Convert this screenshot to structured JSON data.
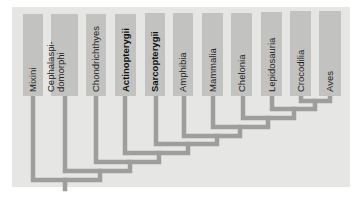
{
  "diagram": {
    "type": "cladogram",
    "colors": {
      "panel": "#e6e6e4",
      "box": "#c2c2c0",
      "branch": "#9e9e9c",
      "text": "#222222"
    },
    "taxa": [
      {
        "id": "mixini",
        "label": "Mixini",
        "bold": false
      },
      {
        "id": "cephalaspidomorphi",
        "label": "Cephalaspi-",
        "label2": "domorphi",
        "bold": false
      },
      {
        "id": "chondrichthyes",
        "label": "Chondrichthyes",
        "bold": false
      },
      {
        "id": "actinopterygii",
        "label": "Actinopterygii",
        "bold": true
      },
      {
        "id": "sarcopterygii",
        "label": "Sarcopterygii",
        "bold": true
      },
      {
        "id": "amphibia",
        "label": "Amphibia",
        "bold": false
      },
      {
        "id": "mammalia",
        "label": "Mammalia",
        "bold": false
      },
      {
        "id": "chelonia",
        "label": "Chelonia",
        "bold": false
      },
      {
        "id": "lepidosauria",
        "label": "Lepidosauria",
        "bold": false
      },
      {
        "id": "crocodilia",
        "label": "Crocodilia",
        "bold": false
      },
      {
        "id": "aves",
        "label": "Aves",
        "bold": false
      }
    ],
    "topology": "(Mixini,(Cephalaspidomorphi,(Chondrichthyes,(Actinopterygii,(Sarcopterygii,(Amphibia,(Mammalia,(Chelonia,(Lepidosauria,(Crocodilia,Aves))))))))))"
  }
}
